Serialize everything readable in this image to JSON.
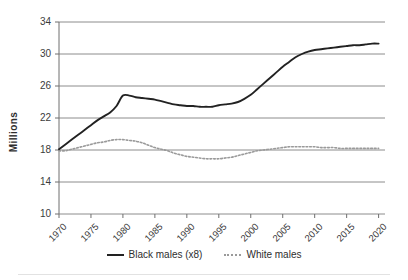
{
  "chart_data": {
    "type": "line",
    "title": "",
    "xlabel": "",
    "ylabel": "Millions",
    "xlim": [
      1970,
      2021
    ],
    "ylim": [
      10,
      34
    ],
    "yticks": [
      10,
      14,
      18,
      22,
      26,
      30,
      34
    ],
    "xticks": [
      1970,
      1975,
      1980,
      1985,
      1990,
      1995,
      2000,
      2005,
      2010,
      2015,
      2020
    ],
    "grid": true,
    "legend_position": "bottom",
    "series": [
      {
        "name": "Black males (x8)",
        "style": "solid",
        "color": "#222222",
        "x": [
          1970,
          1971,
          1972,
          1973,
          1974,
          1975,
          1976,
          1977,
          1978,
          1979,
          1980,
          1981,
          1982,
          1983,
          1984,
          1985,
          1986,
          1987,
          1988,
          1989,
          1990,
          1991,
          1992,
          1993,
          1994,
          1995,
          1996,
          1997,
          1998,
          1999,
          2000,
          2001,
          2002,
          2003,
          2004,
          2005,
          2006,
          2007,
          2008,
          2009,
          2010,
          2011,
          2012,
          2013,
          2014,
          2015,
          2016,
          2017,
          2018,
          2019,
          2020
        ],
        "values": [
          18.1,
          18.7,
          19.3,
          19.9,
          20.5,
          21.1,
          21.7,
          22.2,
          22.7,
          23.5,
          24.8,
          24.8,
          24.6,
          24.5,
          24.4,
          24.3,
          24.1,
          23.9,
          23.7,
          23.6,
          23.5,
          23.5,
          23.4,
          23.4,
          23.4,
          23.6,
          23.7,
          23.8,
          24.0,
          24.4,
          24.9,
          25.6,
          26.3,
          27.0,
          27.7,
          28.4,
          29.0,
          29.6,
          30.0,
          30.3,
          30.5,
          30.6,
          30.7,
          30.8,
          30.9,
          31.0,
          31.1,
          31.1,
          31.2,
          31.3,
          31.3
        ]
      },
      {
        "name": "White males",
        "style": "dotted",
        "color": "#9a9a9a",
        "x": [
          1970,
          1971,
          1972,
          1973,
          1974,
          1975,
          1976,
          1977,
          1978,
          1979,
          1980,
          1981,
          1982,
          1983,
          1984,
          1985,
          1986,
          1987,
          1988,
          1989,
          1990,
          1991,
          1992,
          1993,
          1994,
          1995,
          1996,
          1997,
          1998,
          1999,
          2000,
          2001,
          2002,
          2003,
          2004,
          2005,
          2006,
          2007,
          2008,
          2009,
          2010,
          2011,
          2012,
          2013,
          2014,
          2015,
          2016,
          2017,
          2018,
          2019,
          2020
        ],
        "values": [
          17.9,
          17.9,
          18.1,
          18.3,
          18.5,
          18.7,
          18.9,
          19.0,
          19.2,
          19.3,
          19.3,
          19.2,
          19.1,
          18.9,
          18.6,
          18.3,
          18.1,
          17.9,
          17.6,
          17.4,
          17.2,
          17.1,
          17.0,
          16.9,
          16.9,
          16.9,
          17.0,
          17.1,
          17.3,
          17.5,
          17.7,
          17.9,
          18.0,
          18.1,
          18.2,
          18.3,
          18.4,
          18.4,
          18.4,
          18.4,
          18.4,
          18.3,
          18.3,
          18.3,
          18.2,
          18.2,
          18.2,
          18.2,
          18.2,
          18.2,
          18.2
        ]
      }
    ]
  },
  "axis": {
    "y_title": "Millions",
    "y_tick_labels": [
      "34",
      "30",
      "26",
      "22",
      "18",
      "14",
      "10"
    ],
    "x_tick_labels": [
      "1970",
      "1975",
      "1980",
      "1985",
      "1990",
      "1995",
      "2000",
      "2005",
      "2010",
      "2015",
      "2020"
    ]
  },
  "legend": {
    "entries": [
      {
        "label": "Black males (x8)",
        "style": "solid"
      },
      {
        "label": "White males",
        "style": "dotted"
      }
    ]
  },
  "colors": {
    "black_series": "#222222",
    "white_series": "#9a9a9a",
    "gridline": "#8c8c8c",
    "axis": "#6f6f6f",
    "background": "#ffffff"
  }
}
